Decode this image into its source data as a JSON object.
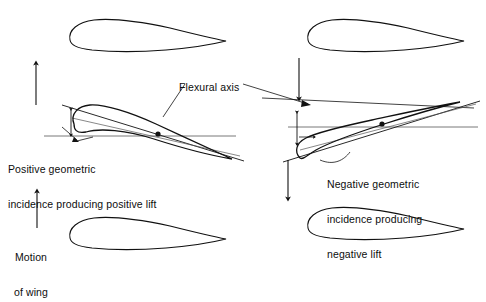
{
  "figure": {
    "type": "aeroelasticity-diagram",
    "background_color": "#ffffff",
    "line_color": "#111111",
    "thin_line_color": "#555555"
  },
  "labels": {
    "flexural_axis": "Flexural axis",
    "positive_line1": "Positive geometric",
    "positive_line2": "incidence producing positive lift",
    "negative_line1": "Negative geometric",
    "negative_line2": "incidence producing",
    "negative_line3": "negative lift",
    "motion_line1": "Motion",
    "motion_line2": "of wing"
  },
  "arrows": {
    "upper_left": {
      "name": "up-arrow",
      "direction": "up"
    },
    "upper_right": {
      "name": "down-arrow",
      "direction": "down"
    },
    "lower_left": {
      "name": "up-arrow",
      "direction": "up"
    },
    "lower_right": {
      "name": "down-arrow",
      "direction": "down"
    }
  },
  "airfoils": [
    {
      "name": "top-left-airfoil",
      "position": "top-left",
      "incidence_deg": 0
    },
    {
      "name": "top-right-airfoil",
      "position": "top-right",
      "incidence_deg": 0
    },
    {
      "name": "middle-left-airfoil",
      "position": "middle-left",
      "incidence_deg": 14
    },
    {
      "name": "middle-right-airfoil",
      "position": "middle-right",
      "incidence_deg": -14
    },
    {
      "name": "bottom-left-airfoil",
      "position": "bottom-left",
      "incidence_deg": 0
    },
    {
      "name": "bottom-right-airfoil",
      "position": "bottom-right",
      "incidence_deg": 0
    }
  ],
  "markers": {
    "left_flexural_point": {
      "name": "flexural-axis-point-left"
    },
    "right_flexural_point": {
      "name": "flexural-axis-point-right"
    }
  }
}
